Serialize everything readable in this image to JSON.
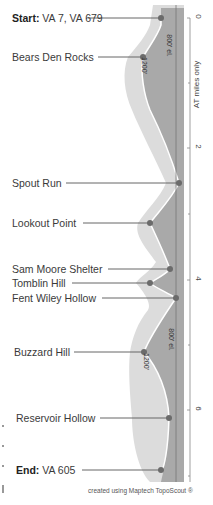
{
  "waypoints": [
    {
      "prefix": "Start:",
      "name": "VA 7, VA 679",
      "y": 18,
      "dot_x": 161
    },
    {
      "prefix": "",
      "name": "Bears Den Rocks",
      "y": 57,
      "dot_x": 143
    },
    {
      "prefix": "",
      "name": "Spout Run",
      "y": 183,
      "dot_x": 179
    },
    {
      "prefix": "",
      "name": "Lookout Point",
      "y": 223,
      "dot_x": 150
    },
    {
      "prefix": "",
      "name": "Sam Moore Shelter",
      "y": 269,
      "dot_x": 170
    },
    {
      "prefix": "",
      "name": "Tomblin Hill",
      "y": 283,
      "dot_x": 150
    },
    {
      "prefix": "",
      "name": "Fent Wiley Hollow",
      "y": 298,
      "dot_x": 176
    },
    {
      "prefix": "",
      "name": "Buzzard Hill",
      "y": 352,
      "dot_x": 144
    },
    {
      "prefix": "",
      "name": "Reservoir Hollow",
      "y": 418,
      "dot_x": 169
    },
    {
      "prefix": "End:",
      "name": "VA 605",
      "y": 470,
      "dot_x": 161
    }
  ],
  "axis": {
    "title": "AT miles only",
    "ticks": [
      {
        "label": "0",
        "y": 18
      },
      {
        "label": "2",
        "y": 148
      },
      {
        "label": "4",
        "y": 280
      },
      {
        "label": "6",
        "y": 410
      }
    ],
    "minor_ticks": [
      83,
      214,
      345,
      476
    ]
  },
  "elevation_labels": [
    {
      "text": "1200'",
      "x": 136,
      "y": 58
    },
    {
      "text": "800' el.",
      "x": 164,
      "y": 40
    },
    {
      "text": "1200'",
      "x": 136,
      "y": 355
    },
    {
      "text": "800' el.",
      "x": 164,
      "y": 330
    }
  ],
  "credit": "created using Maptech TopoScout ®",
  "colors": {
    "dark_band": "#a9a9a9",
    "light_band": "#dcdcdc",
    "profile_line": "#ffffff",
    "dot": "#6b6b6b",
    "leader": "#666666",
    "reference_line": "#777777"
  }
}
